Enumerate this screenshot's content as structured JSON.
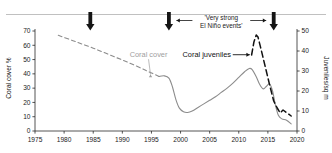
{
  "figure": {
    "background": "#ffffff",
    "top_rule_color": "#b9b9b9"
  },
  "chart_data": {
    "type": "line",
    "title": "",
    "subtitle": "",
    "xlabel": "",
    "ylabel": "Coral cover %",
    "y2label": "Juveniles/sq m",
    "xlim": [
      1975,
      2020
    ],
    "ylim": [
      0,
      70
    ],
    "y2lim": [
      0,
      50
    ],
    "grid": false,
    "legend_position": "inline-annotations",
    "x_ticks": [
      "1975",
      "1980",
      "1985",
      "1990",
      "1995",
      "2000",
      "2005",
      "2010",
      "2015",
      "2020"
    ],
    "x_tick_values": [
      1975,
      1980,
      1985,
      1990,
      1995,
      2000,
      2005,
      2010,
      2015,
      2020
    ],
    "y_ticks": [
      "0",
      "10",
      "20",
      "30",
      "40",
      "50",
      "60",
      "70"
    ],
    "y_tick_values": [
      0,
      10,
      20,
      30,
      40,
      50,
      60,
      70
    ],
    "y2_ticks": [
      "0",
      "10",
      "20",
      "30",
      "40",
      "50"
    ],
    "y2_tick_values": [
      0,
      10,
      20,
      30,
      40,
      50
    ],
    "series": [
      {
        "name": "Coral cover",
        "axis": "left",
        "color": "#8c8c8c",
        "style": "dashed",
        "segment": "historical",
        "x": [
          1979.0,
          1982.0,
          1985.0,
          1988.0,
          1991.0,
          1994.0,
          1996.3
        ],
        "values": [
          67.0,
          62.5,
          58.0,
          53.0,
          48.0,
          42.5,
          38.2
        ]
      },
      {
        "name": "Coral cover",
        "axis": "left",
        "color": "#8c8c8c",
        "style": "solid",
        "segment": "monitored",
        "x": [
          1996.3,
          1997.2,
          1998.0,
          1998.6,
          1999.2,
          1999.8,
          2000.5,
          2001.2,
          2002.0,
          2003.0,
          2004.0,
          2005.0,
          2006.0,
          2007.0,
          2008.0,
          2009.0,
          2010.0,
          2011.0,
          2011.8,
          2012.3,
          2013.0,
          2013.6,
          2014.2,
          2014.8,
          2015.3,
          2015.8,
          2016.3,
          2016.8,
          2017.4,
          2018.2,
          2019.0
        ],
        "values": [
          38.2,
          38.6,
          37.0,
          31.0,
          22.0,
          16.0,
          13.5,
          13.0,
          14.0,
          16.5,
          19.0,
          21.5,
          24.0,
          27.0,
          30.0,
          33.5,
          37.5,
          41.5,
          43.8,
          43.0,
          38.0,
          32.5,
          29.5,
          31.5,
          33.0,
          28.0,
          18.0,
          11.0,
          8.5,
          7.5,
          5.0
        ]
      },
      {
        "name": "Coral juveniles",
        "axis": "right",
        "color": "#111111",
        "style": "dashed",
        "x": [
          2012.2,
          2012.6,
          2013.0,
          2013.3,
          2013.9,
          2014.6,
          2015.3,
          2016.0,
          2016.6,
          2017.1,
          2017.6,
          2018.3,
          2019.0
        ],
        "values": [
          38.0,
          44.5,
          48.0,
          47.0,
          40.0,
          31.5,
          23.0,
          15.0,
          11.5,
          9.0,
          10.5,
          9.0,
          7.5
        ]
      }
    ],
    "annotations": [
      {
        "name": "el-nino-bracket",
        "text_line_1": "'Very strong",
        "text_line_2": "El Niño events'",
        "x_left": 1998,
        "x_right": 2016
      },
      {
        "name": "bleaching-marker",
        "label": "",
        "x_positions": [
          1984.5,
          1998.0,
          2016.0
        ]
      },
      {
        "name": "coral-cover-callout",
        "text": "Coral cover",
        "color": "#9e9e9e",
        "x": 1994.5,
        "y": 52
      },
      {
        "name": "coral-juveniles-callout",
        "text": "Coral juveniles",
        "color": "#111111",
        "x": 2004.5,
        "y": 52
      }
    ]
  },
  "axes": {
    "left_title": "Coral cover %",
    "right_title": "Juveniles/sq m"
  },
  "labels": {
    "coral_cover": "Coral cover",
    "coral_juveniles": "Coral juveniles",
    "el_nino_line1": "'Very strong",
    "el_nino_line2": "El Niño events'"
  }
}
